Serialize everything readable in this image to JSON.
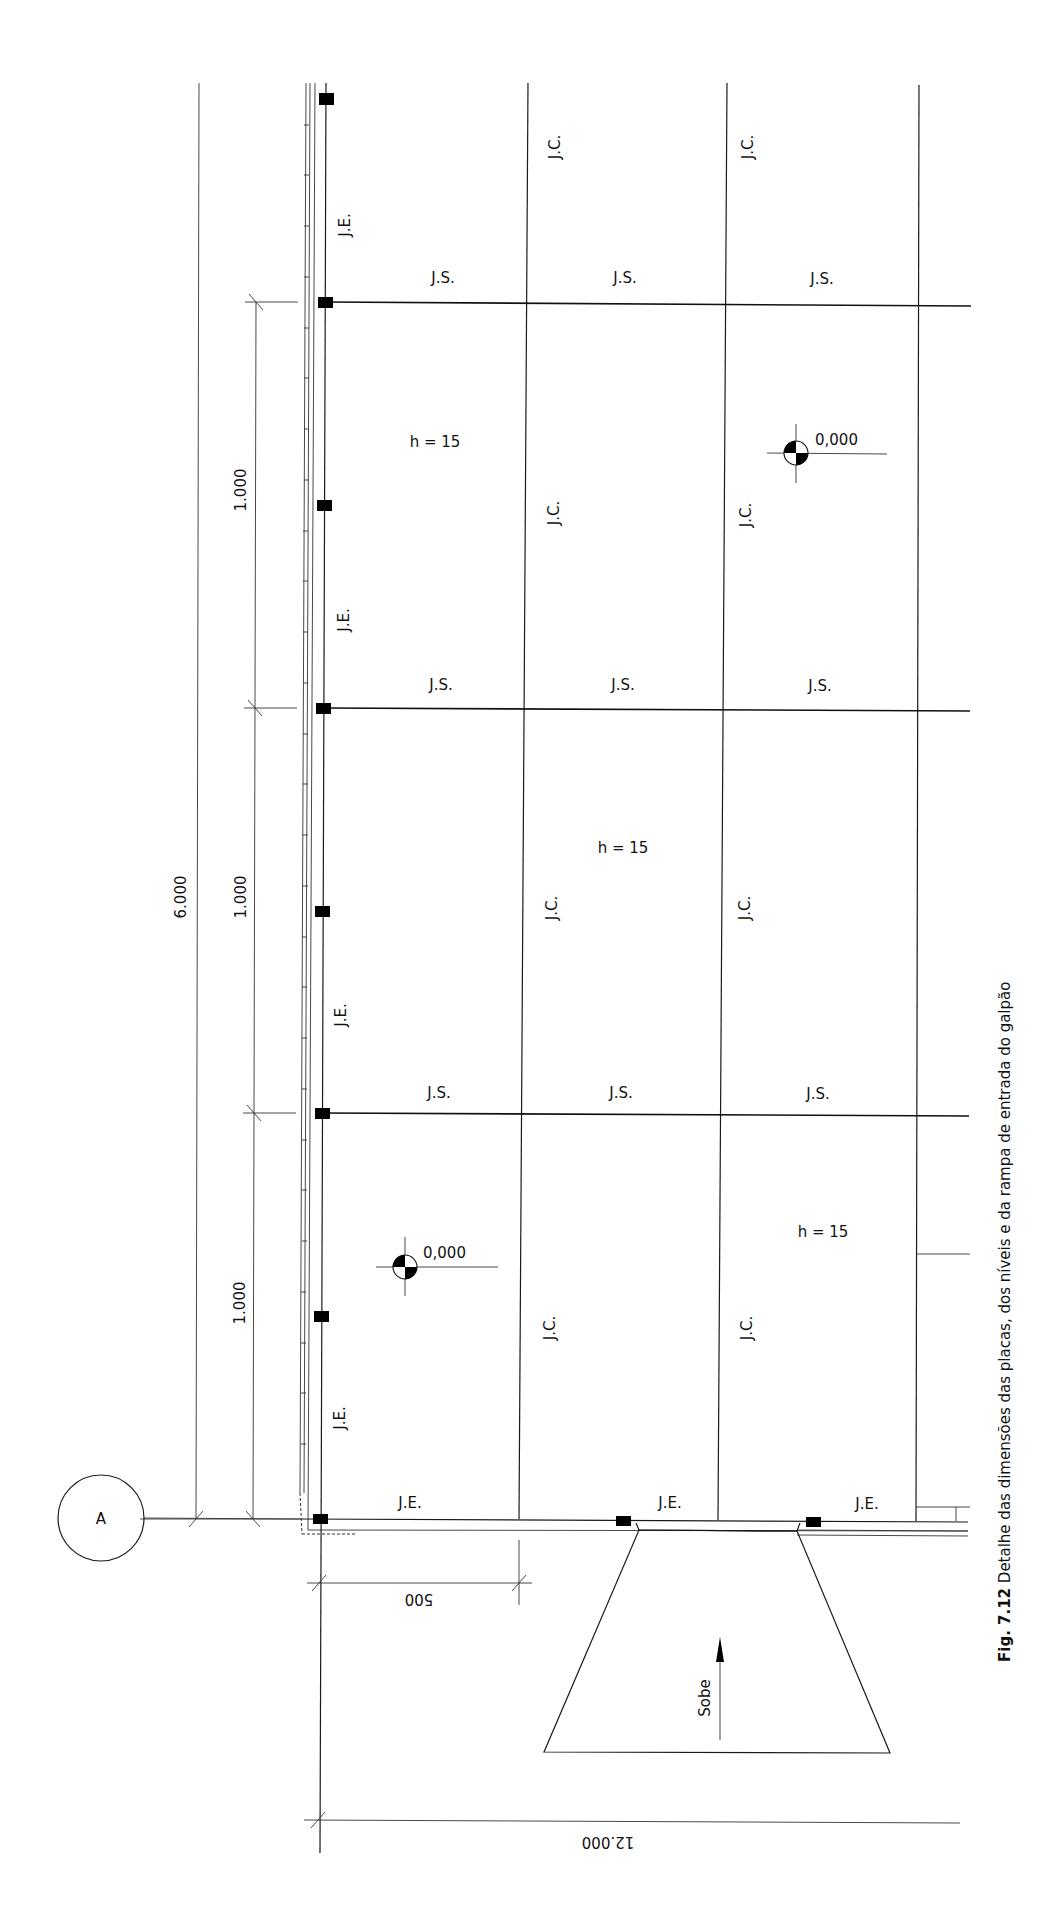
{
  "figure": {
    "caption_number": "Fig. 7.12",
    "caption_text": "Detalhe das dimensões das placas, dos níveis e da rampa de entrada do galpão"
  },
  "grid_reference": {
    "label": "A"
  },
  "dimensions": {
    "overall_vertical": "6.000",
    "slab_vertical": [
      "1.000",
      "1.000",
      "1.000"
    ],
    "horizontal_short": "500",
    "horizontal_overall": "12.000"
  },
  "joint_labels": {
    "expansion": "J.E.",
    "sawn": "J.S.",
    "construction": "J.C."
  },
  "slab_thickness": {
    "label": "h = 15",
    "count": 3
  },
  "levels": [
    {
      "value": "0,000"
    },
    {
      "value": "0,000"
    }
  ],
  "ramp": {
    "label": "Sobe"
  },
  "legend_icons": {
    "dowel": "dowel-square-icon",
    "level": "level-datum-icon",
    "arrow": "arrow-up-icon"
  }
}
